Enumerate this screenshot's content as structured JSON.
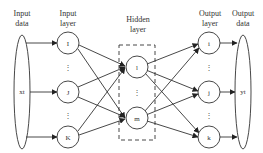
{
  "diagram": {
    "type": "neural-network",
    "headers": {
      "input_data": [
        "Input",
        "data"
      ],
      "input_layer": [
        "Input",
        "layer"
      ],
      "hidden_layer": [
        "Hidden",
        "layer"
      ],
      "output_layer": [
        "Output",
        "layer"
      ],
      "output_data": [
        "Output",
        "data"
      ]
    },
    "input_data_label": "xt",
    "output_data_label": "yt",
    "input_nodes": [
      "I",
      "J",
      "K"
    ],
    "hidden_nodes": [
      "l",
      "m"
    ],
    "output_nodes": [
      "i",
      "j",
      "k"
    ],
    "ellipsis": "⋮",
    "colors": {
      "stroke": "#333333",
      "background": "#ffffff"
    }
  }
}
